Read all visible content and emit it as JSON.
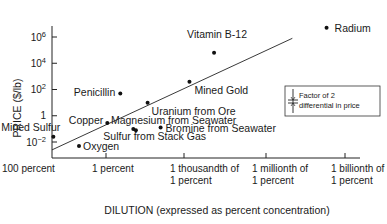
{
  "chart_data": {
    "type": "scatter",
    "title": "",
    "xlabel": "DILUTION (expressed as percent concentration)",
    "ylabel": "PRICE ($/lb)",
    "x_scale": "log (decades of dilution, 100 percent on left)",
    "x_ticks": [
      {
        "value": 0,
        "label_lines": [
          "100 percent"
        ]
      },
      {
        "value": 2,
        "label_lines": [
          "1 percent"
        ]
      },
      {
        "value": 5,
        "label_lines": [
          "1 thousandth of",
          "1 percent"
        ]
      },
      {
        "value": 8,
        "label_lines": [
          "1 millionth of",
          "1 percent"
        ]
      },
      {
        "value": 11,
        "label_lines": [
          "1 billionth of",
          "1 percent"
        ]
      }
    ],
    "x_units_note": "x value = orders of magnitude of dilution below 100 percent",
    "xlim": [
      0,
      12
    ],
    "y_scale": "log10",
    "y_ticks": [
      {
        "value": -2,
        "label": "10",
        "exp": "−2"
      },
      {
        "value": 0,
        "label": "1",
        "exp": ""
      },
      {
        "value": 2,
        "label": "10",
        "exp": "2"
      },
      {
        "value": 4,
        "label": "10",
        "exp": "4"
      },
      {
        "value": 6,
        "label": "10",
        "exp": "6"
      }
    ],
    "ylim_log10": [
      -3.5,
      8
    ],
    "points": [
      {
        "name": "Mined Sulfur",
        "x": 0.05,
        "log10_price": -1.6,
        "label_pos": "above-right"
      },
      {
        "name": "Oxygen",
        "x": 1.0,
        "log10_price": -2.3,
        "label_pos": "right"
      },
      {
        "name": "Copper",
        "x": 2.05,
        "log10_price": -0.55,
        "label_pos": "left"
      },
      {
        "name": "Penicillin",
        "x": 2.55,
        "log10_price": 1.7,
        "label_pos": "left"
      },
      {
        "name": "Sulfur from Stack Gas",
        "x": 3.05,
        "log10_price": -1.0,
        "label_pos": "below"
      },
      {
        "name": "Magnesium from Seawater",
        "x": 3.15,
        "log10_price": -1.1,
        "label_pos": "above"
      },
      {
        "name": "Uranium from Ore",
        "x": 3.6,
        "log10_price": 1.0,
        "label_pos": "below-right"
      },
      {
        "name": "Bromine from Seawater",
        "x": 4.1,
        "log10_price": -0.9,
        "label_pos": "right"
      },
      {
        "name": "Mined Gold",
        "x": 5.2,
        "log10_price": 2.6,
        "label_pos": "below-right"
      },
      {
        "name": "Vitamin B-12",
        "x": 6.1,
        "log10_price": 4.8,
        "label_pos": "above"
      },
      {
        "name": "Radium",
        "x": 10.3,
        "log10_price": 6.7,
        "label_pos": "right"
      }
    ],
    "trend_line": {
      "from": {
        "x": 0,
        "log10_price": -2.6
      },
      "to": {
        "x": 9.0,
        "log10_price": 5.9
      }
    },
    "legend": {
      "position": "right",
      "lines": [
        "Factor of 2",
        "differential in price"
      ],
      "symbol": "error-bar"
    },
    "grid": false
  }
}
